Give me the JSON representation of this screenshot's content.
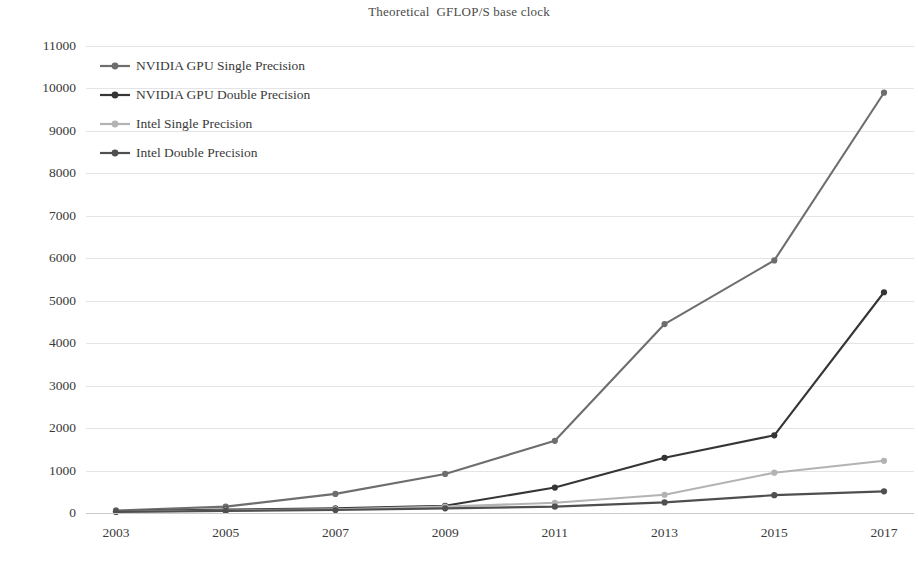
{
  "chart_data": {
    "type": "line",
    "title": "Theoretical  GFLOP/S base clock",
    "xlabel": "",
    "ylabel": "",
    "x": [
      2003,
      2005,
      2007,
      2009,
      2011,
      2013,
      2015,
      2017
    ],
    "categories": [
      "2003",
      "2005",
      "2007",
      "2009",
      "2011",
      "2013",
      "2015",
      "2017"
    ],
    "ylim": [
      0,
      11000
    ],
    "ytick_step": 1000,
    "yticks": [
      "0",
      "1000",
      "2000",
      "3000",
      "4000",
      "5000",
      "6000",
      "7000",
      "8000",
      "9000",
      "10000",
      "11000"
    ],
    "grid": true,
    "legend_position": "top-left",
    "series": [
      {
        "name": "NVIDIA GPU Single Precision",
        "color": "#6e6e6e",
        "values": [
          60,
          150,
          450,
          920,
          1700,
          4450,
          5950,
          9900
        ]
      },
      {
        "name": "NVIDIA GPU Double Precision",
        "color": "#353535",
        "values": [
          40,
          80,
          110,
          170,
          600,
          1300,
          1830,
          5200
        ]
      },
      {
        "name": "Intel Single Precision",
        "color": "#b3b3b3",
        "values": [
          30,
          60,
          90,
          150,
          240,
          430,
          950,
          1230
        ]
      },
      {
        "name": "Intel Double Precision",
        "color": "#4f4f4f",
        "values": [
          25,
          50,
          70,
          110,
          150,
          250,
          420,
          510
        ]
      }
    ]
  }
}
